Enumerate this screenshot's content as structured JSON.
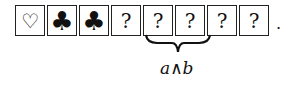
{
  "cards": [
    {
      "symbol": "heart",
      "glyph": "♡"
    },
    {
      "symbol": "club",
      "glyph": "♣"
    },
    {
      "symbol": "club",
      "glyph": "♣"
    },
    {
      "symbol": "unknown",
      "glyph": "?"
    },
    {
      "symbol": "unknown",
      "glyph": "?"
    },
    {
      "symbol": "unknown",
      "glyph": "?"
    },
    {
      "symbol": "unknown",
      "glyph": "?"
    },
    {
      "symbol": "unknown",
      "glyph": "?"
    }
  ],
  "terminator": ".",
  "brace_label": {
    "left": "a",
    "operator": "∧",
    "right": "b"
  },
  "brace_spans_cards": [
    5,
    6
  ]
}
